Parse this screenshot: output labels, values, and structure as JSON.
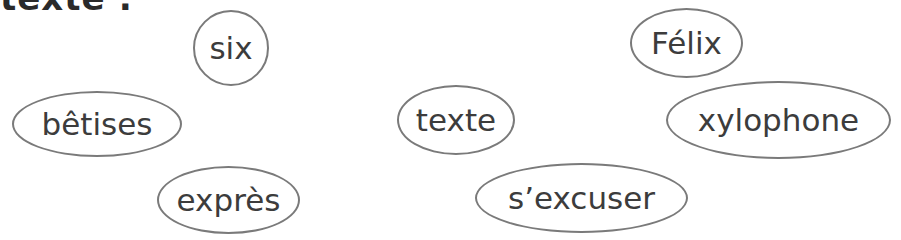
{
  "heading": {
    "text": "texte :"
  },
  "words": [
    {
      "label": "six",
      "x": 193,
      "y": 10,
      "w": 76,
      "h": 76
    },
    {
      "label": "Félix",
      "x": 630,
      "y": 8,
      "w": 113,
      "h": 70
    },
    {
      "label": "bêtises",
      "x": 12,
      "y": 91,
      "w": 170,
      "h": 66
    },
    {
      "label": "texte",
      "x": 397,
      "y": 85,
      "w": 118,
      "h": 70
    },
    {
      "label": "xylophone",
      "x": 666,
      "y": 81,
      "w": 225,
      "h": 78
    },
    {
      "label": "exprès",
      "x": 157,
      "y": 166,
      "w": 143,
      "h": 68
    },
    {
      "label": "s’excuser",
      "x": 475,
      "y": 163,
      "w": 213,
      "h": 70
    }
  ]
}
